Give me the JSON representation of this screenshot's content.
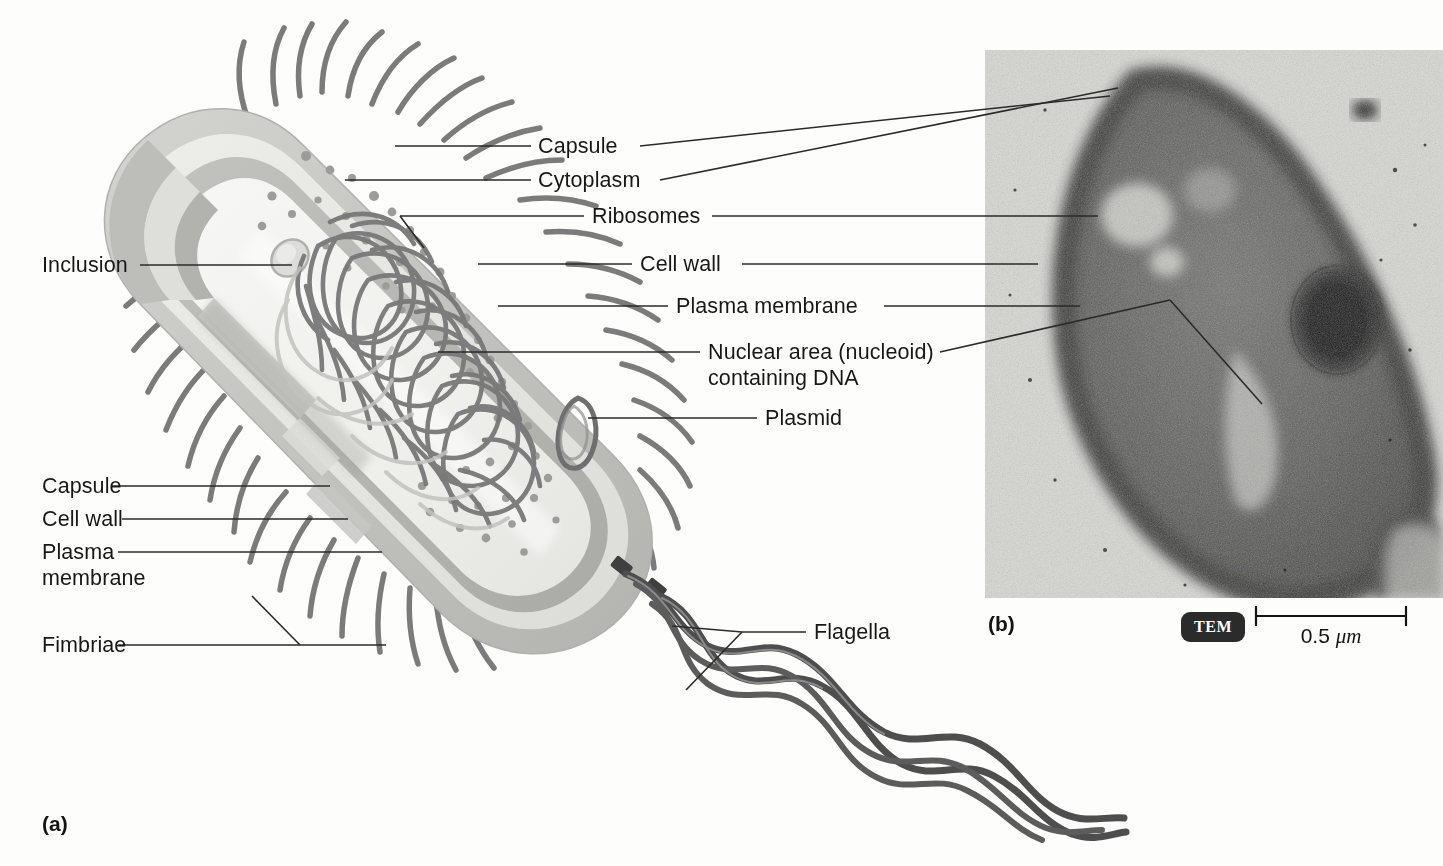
{
  "figure": {
    "panel_a_tag": "(a)",
    "panel_b_tag": "(b)",
    "micrograph_type": "TEM",
    "scale_value": "0.5 ",
    "scale_unit": "μm"
  },
  "labels": {
    "capsule_right": "Capsule",
    "cytoplasm": "Cytoplasm",
    "ribosomes": "Ribosomes",
    "cell_wall_right": "Cell wall",
    "plasma_membrane_right": "Plasma membrane",
    "nucleoid_line1": "Nuclear area (nucleoid)",
    "nucleoid_line2": "containing DNA",
    "plasmid": "Plasmid",
    "inclusion": "Inclusion",
    "capsule_left": "Capsule",
    "cell_wall_left": "Cell wall",
    "plasma_left_line1": "Plasma",
    "plasma_left_line2": "membrane",
    "fimbriae": "Fimbriae",
    "flagella": "Flagella"
  },
  "colors": {
    "background": "#fdfdfc",
    "text": "#181818",
    "leader_line": "#2a2a2a",
    "capsule_outer": "#c9c9c6",
    "cell_wall": "#e3e3e0",
    "plasma_membrane": "#b7b7b4",
    "cytoplasm": "#f0f0ee",
    "nucleoid_strand": "#6f6f6f",
    "ribosome_dot": "#9a9a98",
    "fimbriae": "#7d7d7d",
    "flagella": "#4e4e4e",
    "badge_bg": "#2b2b2b",
    "badge_text": "#ffffff",
    "micrograph_light": "#d6d6d2",
    "micrograph_dark": "#3a3a38"
  }
}
